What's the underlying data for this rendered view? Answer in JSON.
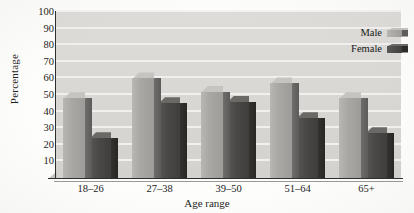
{
  "chart_data": {
    "type": "bar",
    "title": "",
    "xlabel": "Age range",
    "ylabel": "Percentage",
    "categories": [
      "18–26",
      "27–38",
      "39–50",
      "51–64",
      "65+"
    ],
    "series": [
      {
        "name": "Male",
        "values": [
          48,
          60,
          52,
          57,
          48
        ],
        "color": "#a9a7a4"
      },
      {
        "name": "Female",
        "values": [
          24,
          45,
          46,
          36,
          27
        ],
        "color": "#4a4846"
      }
    ],
    "ylim": [
      0,
      100
    ],
    "yticks": [
      10,
      20,
      30,
      40,
      50,
      60,
      70,
      80,
      90,
      100
    ],
    "ytick_labels": [
      "10",
      "20",
      "30",
      "40",
      "50",
      "60",
      "70",
      "80",
      "90",
      "100"
    ],
    "grid": true,
    "grid_axis": "y",
    "legend_position": "top-right",
    "style": "3d-grouped-bars-grayscale",
    "plot_background": "#d9d7d4",
    "gridline_color": "#f3f2f0",
    "axis_color": "#2e2e2e"
  },
  "legend": {
    "entries": [
      {
        "label": "Male"
      },
      {
        "label": "Female"
      }
    ]
  },
  "axes": {
    "y_title": "Percentage",
    "x_title": "Age range"
  }
}
